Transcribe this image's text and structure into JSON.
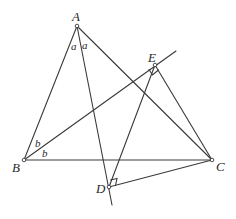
{
  "diagram": {
    "type": "geometry",
    "points": {
      "A": {
        "label": "A",
        "x": 77,
        "y": 26
      },
      "B": {
        "label": "B",
        "x": 24,
        "y": 160
      },
      "C": {
        "label": "C",
        "x": 212,
        "y": 160
      },
      "D": {
        "label": "D",
        "x": 109,
        "y": 187
      },
      "E": {
        "label": "E",
        "x": 155,
        "y": 65
      }
    },
    "angle_labels": {
      "a1": "a",
      "a2": "a",
      "b1": "b",
      "b2": "b"
    },
    "segments": [
      "AB",
      "AC",
      "BC",
      "AD (extended)",
      "BE (extended)",
      "CE",
      "CD",
      "DE"
    ],
    "right_angles": [
      "E",
      "D"
    ],
    "color": "#3a3a3a"
  }
}
